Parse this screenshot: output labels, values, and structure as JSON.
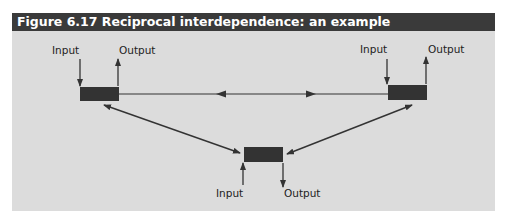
{
  "figure": {
    "title": "Figure 6.17 Reciprocal interdependence: an example",
    "colors": {
      "header_bg": "#3a3a3a",
      "panel_bg": "#dcdcdc",
      "box_fill": "#333333",
      "line": "#333333"
    },
    "nodes": [
      {
        "id": "left-unit",
        "input_label": "Input",
        "output_label": "Output"
      },
      {
        "id": "right-unit",
        "input_label": "Input",
        "output_label": "Output"
      },
      {
        "id": "bottom-unit",
        "input_label": "Input",
        "output_label": "Output"
      }
    ],
    "connections": [
      {
        "from": "left-unit",
        "to": "right-unit",
        "type": "bidirectional"
      },
      {
        "from": "left-unit",
        "to": "bottom-unit",
        "type": "bidirectional"
      },
      {
        "from": "right-unit",
        "to": "bottom-unit",
        "type": "bidirectional"
      }
    ]
  }
}
